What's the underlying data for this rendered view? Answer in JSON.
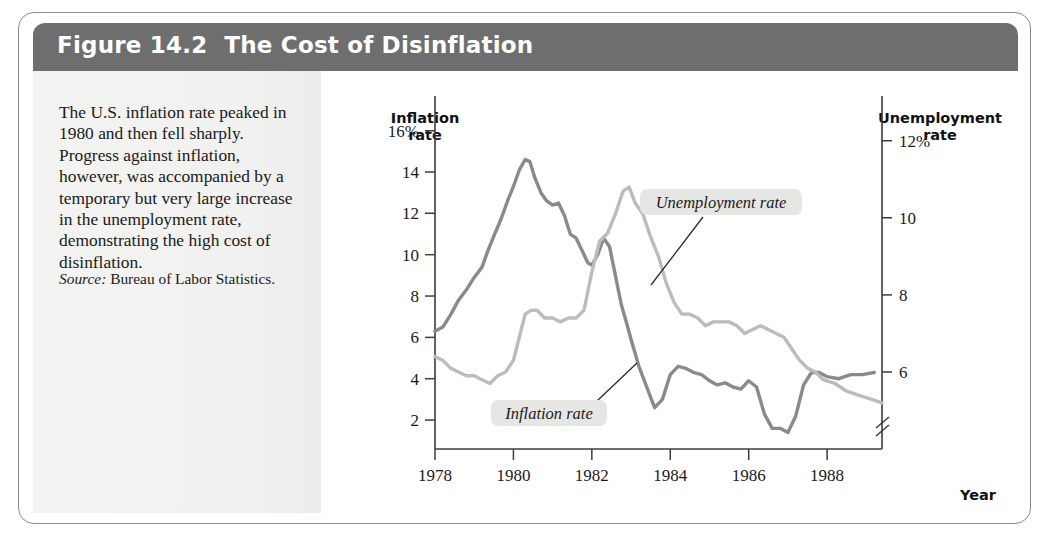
{
  "figure": {
    "number": "Figure 14.2",
    "title": "The Cost of Disinflation",
    "caption": "The U.S. inflation rate peaked in 1980 and then fell sharply. Progress against inflation, however, was accompanied by a temporary but very large increase in the unemployment rate, demonstrating the high cost of disinflation.",
    "source_label": "Source:",
    "source_text": "Bureau of Labor Statistics."
  },
  "colors": {
    "header_bar": "#6e6e6e",
    "caption_panel": "#f2f2f0",
    "frame_border": "#8c8c8c",
    "inflation_line": "#8a8a8a",
    "unemployment_line": "#bcbcbc",
    "axis": "#3c3c3c",
    "label_chip": "#e6e6e4"
  },
  "chart_data": {
    "type": "line",
    "title": "The Cost of Disinflation",
    "xlabel": "Year",
    "grid": false,
    "legend_position": "inline-annotation",
    "x_axis": {
      "label": "Year",
      "ticks": [
        "1978",
        "1980",
        "1982",
        "1984",
        "1986",
        "1988"
      ],
      "tick_values": [
        1978,
        1980,
        1982,
        1984,
        1986,
        1988
      ],
      "range": [
        1978,
        1989.4
      ]
    },
    "y_axis_left": {
      "title_line1": "Inflation",
      "title_line2": "rate",
      "ticks": [
        "16%",
        "14",
        "12",
        "10",
        "8",
        "6",
        "4",
        "2"
      ],
      "tick_values": [
        16,
        14,
        12,
        10,
        8,
        6,
        4,
        2
      ],
      "range": [
        0.6,
        17.0
      ]
    },
    "y_axis_right": {
      "title_line1": "Unemployment",
      "title_line2": "rate",
      "ticks": [
        "12%",
        "10",
        "8",
        "6"
      ],
      "tick_values": [
        12,
        10,
        8,
        6
      ],
      "range": [
        4.0,
        12.8
      ],
      "has_axis_break": true
    },
    "annotations": [
      {
        "text": "Inflation rate",
        "series": "inflation"
      },
      {
        "text": "Unemployment rate",
        "series": "unemployment"
      }
    ],
    "series": [
      {
        "name": "Inflation rate",
        "axis": "left",
        "unit": "percent",
        "x": [
          1978.0,
          1978.2,
          1978.4,
          1978.6,
          1978.8,
          1979.0,
          1979.2,
          1979.35,
          1979.5,
          1979.7,
          1979.85,
          1980.0,
          1980.15,
          1980.3,
          1980.42,
          1980.55,
          1980.7,
          1980.85,
          1981.0,
          1981.15,
          1981.3,
          1981.45,
          1981.6,
          1981.75,
          1981.9,
          1982.0,
          1982.15,
          1982.3,
          1982.45,
          1982.6,
          1982.75,
          1982.9,
          1983.0,
          1983.2,
          1983.4,
          1983.6,
          1983.8,
          1984.0,
          1984.2,
          1984.4,
          1984.6,
          1984.8,
          1985.0,
          1985.2,
          1985.4,
          1985.6,
          1985.8,
          1986.0,
          1986.2,
          1986.4,
          1986.6,
          1986.8,
          1987.0,
          1987.2,
          1987.4,
          1987.6,
          1987.8,
          1988.0,
          1988.3,
          1988.6,
          1988.9,
          1989.2
        ],
        "values": [
          6.3,
          6.5,
          7.1,
          7.8,
          8.3,
          8.9,
          9.4,
          10.2,
          10.9,
          11.8,
          12.6,
          13.3,
          14.1,
          14.6,
          14.5,
          13.7,
          13.0,
          12.6,
          12.4,
          12.5,
          11.9,
          11.0,
          10.8,
          10.2,
          9.6,
          9.5,
          10.0,
          10.8,
          10.4,
          9.0,
          7.6,
          6.6,
          5.9,
          4.6,
          3.6,
          2.6,
          3.0,
          4.2,
          4.6,
          4.5,
          4.3,
          4.2,
          3.9,
          3.7,
          3.8,
          3.6,
          3.5,
          3.9,
          3.6,
          2.3,
          1.6,
          1.6,
          1.4,
          2.2,
          3.7,
          4.3,
          4.3,
          4.1,
          4.0,
          4.2,
          4.2,
          4.3
        ]
      },
      {
        "name": "Unemployment rate",
        "axis": "right",
        "unit": "percent",
        "x": [
          1978.0,
          1978.2,
          1978.4,
          1978.6,
          1978.8,
          1979.0,
          1979.2,
          1979.4,
          1979.6,
          1979.8,
          1980.0,
          1980.15,
          1980.3,
          1980.45,
          1980.6,
          1980.8,
          1981.0,
          1981.2,
          1981.4,
          1981.6,
          1981.8,
          1982.0,
          1982.2,
          1982.4,
          1982.6,
          1982.8,
          1982.95,
          1983.1,
          1983.3,
          1983.5,
          1983.7,
          1983.9,
          1984.1,
          1984.3,
          1984.5,
          1984.7,
          1984.9,
          1985.1,
          1985.3,
          1985.5,
          1985.7,
          1985.9,
          1986.1,
          1986.3,
          1986.5,
          1986.7,
          1986.9,
          1987.1,
          1987.3,
          1987.5,
          1987.7,
          1987.9,
          1988.2,
          1988.5,
          1988.8,
          1989.1,
          1989.4
        ],
        "values": [
          6.4,
          6.3,
          6.1,
          6.0,
          5.9,
          5.9,
          5.8,
          5.7,
          5.9,
          6.0,
          6.3,
          6.9,
          7.5,
          7.6,
          7.6,
          7.4,
          7.4,
          7.3,
          7.4,
          7.4,
          7.6,
          8.6,
          9.4,
          9.6,
          10.1,
          10.7,
          10.8,
          10.4,
          10.1,
          9.5,
          9.0,
          8.3,
          7.8,
          7.5,
          7.5,
          7.4,
          7.2,
          7.3,
          7.3,
          7.3,
          7.2,
          7.0,
          7.1,
          7.2,
          7.1,
          7.0,
          6.9,
          6.6,
          6.3,
          6.1,
          6.0,
          5.8,
          5.7,
          5.5,
          5.4,
          5.3,
          5.2
        ]
      }
    ]
  }
}
